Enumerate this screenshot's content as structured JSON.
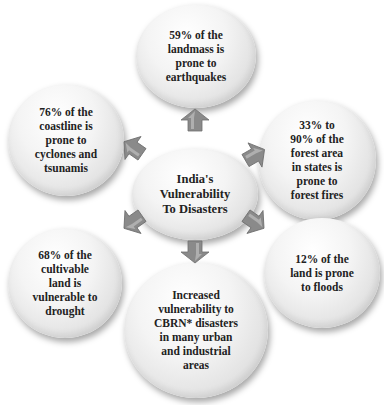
{
  "diagram": {
    "center": {
      "label": "India's\nVulnerability\nTo Disasters"
    },
    "nodes": [
      {
        "id": "top",
        "label": "59% of the\nlandmass is\nprone to\nearthquakes"
      },
      {
        "id": "top-right",
        "label": "33% to\n90%  of the\nforest area\nin states is\nprone to\nforest fires"
      },
      {
        "id": "bottom-right",
        "label": "12% of the\nland is prone\nto floods"
      },
      {
        "id": "bottom",
        "label": "Increased\nvulnerability to\nCBRN* disasters\nin many urban\nand industrial\nareas"
      },
      {
        "id": "bottom-left",
        "label": "68% of the\ncultivable\nland is\nvulnerable to\ndrought"
      },
      {
        "id": "top-left",
        "label": "76% of the\ncoastline is\nprone to\ncyclones and\ntsunamis"
      }
    ],
    "colors": {
      "arrow": "#8a8a8a",
      "arrow_highlight": "#c8c8c8",
      "text": "#222222"
    }
  }
}
